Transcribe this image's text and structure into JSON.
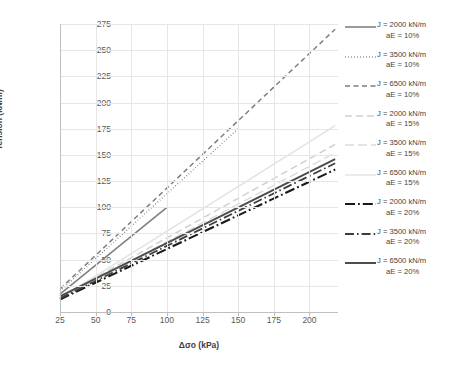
{
  "chart_data": {
    "type": "line",
    "title": "",
    "xlabel": "Δσo (kPa)",
    "ylabel": "Tension (kN/m)",
    "xlim": [
      25,
      220
    ],
    "ylim": [
      0,
      275
    ],
    "xticks": [
      25,
      50,
      75,
      100,
      125,
      150,
      175,
      200
    ],
    "yticks": [
      0,
      25,
      50,
      75,
      100,
      125,
      150,
      175,
      200,
      225,
      250,
      275
    ],
    "grid": true,
    "legend_position": "right",
    "series": [
      {
        "name": "J = 2000 kN/m aE = 10%",
        "label_line1": "J = 2000 kN/m",
        "label_line2": "aE = 10%",
        "style": "solid",
        "color": "#808080",
        "width": 1.6,
        "x": [
          25,
          100
        ],
        "y": [
          17,
          100
        ]
      },
      {
        "name": "J = 3500 kN/m aE = 10%",
        "label_line1": "J = 3500 kN/m",
        "label_line2": "aE = 10%",
        "style": "dotted",
        "color": "#595959",
        "width": 1.4,
        "x": [
          25,
          150
        ],
        "y": [
          20,
          175
        ]
      },
      {
        "name": "J = 6500 kN/m aE = 10%",
        "label_line1": "J = 6500 kN/m",
        "label_line2": "aE = 10%",
        "style": "dashed",
        "color": "#7f7f7f",
        "width": 1.5,
        "x": [
          25,
          218
        ],
        "y": [
          22,
          270
        ]
      },
      {
        "name": "J = 2000 kN/m aE = 15%",
        "label_line1": "J = 2000 kN/m",
        "label_line2": "aE = 15%",
        "style": "dashed-light",
        "color": "#d0d0d0",
        "width": 1.5,
        "x": [
          25,
          218
        ],
        "y": [
          14,
          160
        ]
      },
      {
        "name": "J = 3500 kN/m aE = 15%",
        "label_line1": "J = 3500 kN/m",
        "label_line2": "aE = 15%",
        "style": "dashed-light2",
        "color": "#dcdcdc",
        "width": 1.4,
        "x": [
          25,
          218
        ],
        "y": [
          13,
          152
        ]
      },
      {
        "name": "J = 6500 kN/m aE = 15%",
        "label_line1": "J = 6500 kN/m",
        "label_line2": "aE = 15%",
        "style": "solid-light",
        "color": "#e2e2e2",
        "width": 1.4,
        "x": [
          25,
          218
        ],
        "y": [
          13,
          178
        ]
      },
      {
        "name": "J = 2000 kN/m aE = 20%",
        "label_line1": "J = 2000 kN/m",
        "label_line2": "aE = 20%",
        "style": "dashdot-heavy",
        "color": "#1a1a1a",
        "width": 2.1,
        "x": [
          25,
          218
        ],
        "y": [
          12,
          136
        ]
      },
      {
        "name": "J = 3500 kN/m aE = 20%",
        "label_line1": "J = 3500 kN/m",
        "label_line2": "aE = 20%",
        "style": "dashdot",
        "color": "#3d3d3d",
        "width": 1.8,
        "x": [
          25,
          218
        ],
        "y": [
          13,
          142
        ]
      },
      {
        "name": "J = 6500 kN/m aE = 20%",
        "label_line1": "J = 6500 kN/m",
        "label_line2": "aE = 20%",
        "style": "solid-heavy",
        "color": "#4d4d4d",
        "width": 2.0,
        "x": [
          25,
          218
        ],
        "y": [
          15,
          146
        ]
      }
    ]
  }
}
